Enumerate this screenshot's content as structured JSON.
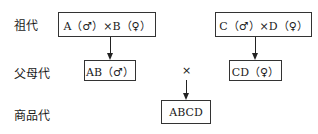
{
  "rows": {
    "grandparent": {
      "label": "祖代"
    },
    "parent": {
      "label": "父母代"
    },
    "commercial": {
      "label": "商品代"
    }
  },
  "boxes": {
    "ab_cross": "A（♂）×B（♀）",
    "cd_cross": "C（♂）×D（♀）",
    "ab_male": "AB（♂）",
    "cd_female": "CD（♀）",
    "abcd": "ABCD"
  },
  "cross_symbol": "×",
  "colors": {
    "line": "#222222",
    "border": "#333333",
    "text": "#1a1a1a"
  }
}
